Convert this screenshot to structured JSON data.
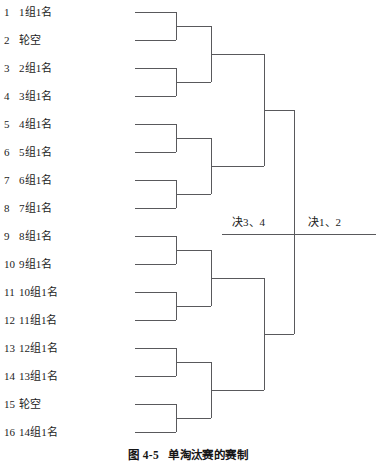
{
  "figure": {
    "caption_number": "图 4-5",
    "caption_title": "单淘汰赛的赛制"
  },
  "bracket": {
    "type": "single-elimination",
    "entry_count": 16,
    "entries": [
      {
        "seed": "1",
        "name": "1组1名"
      },
      {
        "seed": "2",
        "name": "轮空"
      },
      {
        "seed": "3",
        "name": "2组1名"
      },
      {
        "seed": "4",
        "name": "3组1名"
      },
      {
        "seed": "5",
        "name": "4组1名"
      },
      {
        "seed": "6",
        "name": "5组1名"
      },
      {
        "seed": "7",
        "name": "6组1名"
      },
      {
        "seed": "8",
        "name": "7组1名"
      },
      {
        "seed": "9",
        "name": "8组1名"
      },
      {
        "seed": "10",
        "name": "9组1名"
      },
      {
        "seed": "11",
        "name": "10组1名"
      },
      {
        "seed": "12",
        "name": "11组1名"
      },
      {
        "seed": "13",
        "name": "12组1名"
      },
      {
        "seed": "14",
        "name": "13组1名"
      },
      {
        "seed": "15",
        "name": "轮空"
      },
      {
        "seed": "16",
        "name": "14组1名"
      }
    ],
    "final_labels": {
      "third_place": "决3、4",
      "championship": "决1、2"
    }
  },
  "colors": {
    "line": "#59595c",
    "text": "#1c1c1c",
    "background": "#ffffff"
  }
}
